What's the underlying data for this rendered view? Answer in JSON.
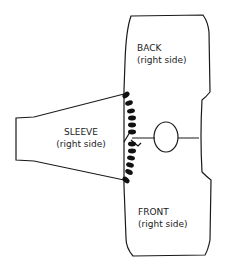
{
  "diagram": {
    "type": "sewing-assembly-illustration",
    "pieces": [
      {
        "id": "back",
        "title": "BACK",
        "subtitle": "(right side)"
      },
      {
        "id": "sleeve",
        "title": "SLEEVE",
        "subtitle": "(right side)"
      },
      {
        "id": "front",
        "title": "FRONT",
        "subtitle": "(right side)"
      }
    ],
    "annotations": {
      "seam": "whip-stitched seam joining sleeve to body",
      "marker": "circle on center line (shoulder/yarn marker)"
    },
    "colors": {
      "line": "#1a1a1a",
      "background": "#ffffff"
    }
  }
}
